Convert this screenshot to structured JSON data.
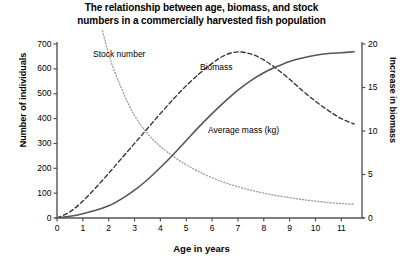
{
  "chart_data": {
    "type": "line",
    "title": "The relationship between age, biomass, and stock numbers in a commercially harvested fish population",
    "title_line1": "The relationship between age, biomass, and stock",
    "title_line2": "numbers in a commercially harvested fish population",
    "xlabel": "Age in years",
    "ylabel": "Number of individuals",
    "ylabel_right": "Increase in biomass",
    "xlim": [
      0,
      11.8
    ],
    "ylim": [
      0,
      700
    ],
    "ylim_right": [
      0,
      20
    ],
    "xticks": [
      0,
      1,
      2,
      3,
      4,
      5,
      6,
      7,
      8,
      9,
      10,
      11
    ],
    "xticklabels": [
      "0",
      "1",
      "2",
      "3",
      "4",
      "5",
      "6",
      "7",
      "8",
      "9",
      "10",
      "11"
    ],
    "yticks": [
      0,
      100,
      200,
      300,
      400,
      500,
      600,
      700
    ],
    "yticklabels": [
      "0",
      "100",
      "200",
      "300",
      "400",
      "500",
      "600",
      "700"
    ],
    "yticks_right": [
      0,
      5,
      10,
      15,
      20
    ],
    "yticklabels_right": [
      "0",
      "5",
      "10",
      "15",
      "20"
    ],
    "grid": false,
    "legend_position": "inline-annotations",
    "x": [
      0,
      0.5,
      1,
      1.5,
      2,
      2.5,
      3,
      3.5,
      4,
      4.5,
      5,
      5.5,
      6,
      6.5,
      7,
      7.5,
      8,
      8.5,
      9,
      9.5,
      10,
      10.5,
      11,
      11.5
    ],
    "series": [
      {
        "name": "Stock number",
        "style": "dotted",
        "color": "#9a9a9a",
        "axis": "left",
        "units": "individuals",
        "values": [
          2400,
          1700,
          1200,
          880,
          660,
          520,
          412,
          340,
          288,
          248,
          214,
          186,
          162,
          142,
          126,
          112,
          100,
          90,
          82,
          74,
          68,
          62,
          58,
          55
        ]
      },
      {
        "name": "Biomass",
        "style": "dashed",
        "color": "#333333",
        "axis": "left",
        "units": "individuals",
        "values": [
          0,
          25,
          68,
          122,
          180,
          240,
          300,
          360,
          420,
          478,
          532,
          580,
          622,
          655,
          668,
          660,
          636,
          600,
          558,
          512,
          470,
          432,
          400,
          378
        ]
      },
      {
        "name": "Average mass (kg)",
        "style": "solid",
        "color": "#555555",
        "axis": "right",
        "units": "kg",
        "values": [
          0.0,
          0.2,
          0.5,
          0.9,
          1.4,
          2.2,
          3.2,
          4.4,
          5.8,
          7.3,
          8.9,
          10.5,
          12.0,
          13.4,
          14.7,
          15.8,
          16.7,
          17.4,
          18.0,
          18.4,
          18.7,
          18.9,
          19.0,
          19.1
        ]
      }
    ],
    "annotations": [
      {
        "name": "Stock number",
        "x": 2.1,
        "y": 640
      },
      {
        "name": "Biomass",
        "x": 6.1,
        "y": 580
      },
      {
        "name": "Average mass (kg)",
        "x": 6.4,
        "y": 290
      }
    ]
  }
}
